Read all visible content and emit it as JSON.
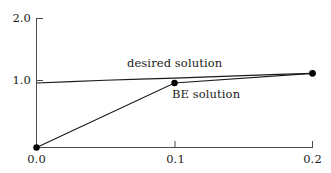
{
  "chart_data": {
    "type": "line",
    "title": "",
    "xlabel": "",
    "ylabel": "",
    "xlim": [
      0.0,
      0.2
    ],
    "ylim": [
      0.0,
      2.0
    ],
    "xticks": [
      "0.0",
      "0.1",
      "0.2"
    ],
    "xtick_values": [
      0.0,
      0.1,
      0.2
    ],
    "yticks": [
      "1.0",
      "2.0"
    ],
    "ytick_values": [
      1.0,
      2.0
    ],
    "grid": false,
    "legend_position": "inline-annotation",
    "series": [
      {
        "name": "desired solution",
        "label": "desired solution",
        "color": "#1a1a1a",
        "x": [
          0.0,
          0.025,
          0.05,
          0.075,
          0.1,
          0.125,
          0.15,
          0.175,
          0.2
        ],
        "values": [
          1.0,
          1.022,
          1.043,
          1.06,
          1.075,
          1.095,
          1.115,
          1.133,
          1.15
        ],
        "markers": [
          {
            "x": 0.2,
            "y": 1.15
          }
        ]
      },
      {
        "name": "BE solution",
        "label": "BE solution",
        "color": "#1a1a1a",
        "x": [
          0.0,
          0.1,
          0.2
        ],
        "values": [
          0.0,
          1.0,
          1.15
        ],
        "markers": [
          {
            "x": 0.0,
            "y": 0.0
          },
          {
            "x": 0.1,
            "y": 1.0
          },
          {
            "x": 0.2,
            "y": 1.15
          }
        ]
      }
    ],
    "annotations": [
      {
        "text": "desired solution",
        "x": 0.085,
        "y": 1.19
      },
      {
        "text": "BE solution",
        "x": 0.115,
        "y": 0.88
      }
    ]
  },
  "axes": {
    "y_tick_2": "2.0",
    "y_tick_1": "1.0",
    "x_tick_0": "0.0",
    "x_tick_1": "0.1",
    "x_tick_2": "0.2"
  },
  "labels": {
    "desired_solution": "desired solution",
    "be_solution": "BE solution"
  },
  "style": {
    "axis_color": "#4a4a4a",
    "line_color": "#1a1a1a",
    "marker_color": "#000000",
    "background": "#ffffff"
  }
}
